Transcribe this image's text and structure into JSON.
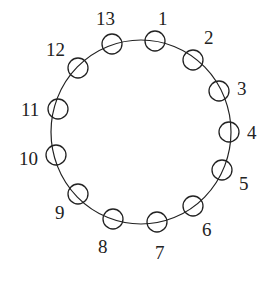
{
  "diagram": {
    "type": "circular-ring-of-nodes",
    "ring": {
      "cx": 141,
      "cy": 132,
      "rx": 90,
      "ry": 92
    },
    "node_radius": 10,
    "stroke_color": "#222222",
    "nodes": [
      {
        "label": "1",
        "cx": 155,
        "cy": 41,
        "lx": 158,
        "ly": 25
      },
      {
        "label": "2",
        "cx": 193,
        "cy": 60,
        "lx": 204,
        "ly": 44
      },
      {
        "label": "3",
        "cx": 219,
        "cy": 91,
        "lx": 237,
        "ly": 95
      },
      {
        "label": "4",
        "cx": 229,
        "cy": 132,
        "lx": 247,
        "ly": 139
      },
      {
        "label": "5",
        "cx": 222,
        "cy": 170,
        "lx": 239,
        "ly": 190
      },
      {
        "label": "6",
        "cx": 193,
        "cy": 206,
        "lx": 202,
        "ly": 236
      },
      {
        "label": "7",
        "cx": 157,
        "cy": 222,
        "lx": 155,
        "ly": 259
      },
      {
        "label": "8",
        "cx": 113,
        "cy": 219,
        "lx": 98,
        "ly": 253
      },
      {
        "label": "9",
        "cx": 78,
        "cy": 194,
        "lx": 55,
        "ly": 219
      },
      {
        "label": "10",
        "cx": 56,
        "cy": 155,
        "lx": 19,
        "ly": 165
      },
      {
        "label": "11",
        "cx": 58,
        "cy": 109,
        "lx": 21,
        "ly": 116
      },
      {
        "label": "12",
        "cx": 78,
        "cy": 68,
        "lx": 46,
        "ly": 56
      },
      {
        "label": "13",
        "cx": 112,
        "cy": 44,
        "lx": 96,
        "ly": 25
      }
    ]
  }
}
